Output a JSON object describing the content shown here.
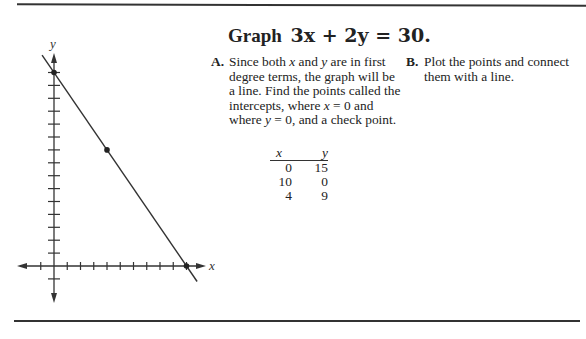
{
  "title": {
    "prefix": "Graph",
    "equation": "3x + 2y = 30."
  },
  "steps": [
    {
      "letter": "A.",
      "text_parts": [
        "Since both ",
        "x",
        " and ",
        "y",
        " are in first degree terms, the graph will be a line. Find the points called the intercepts, where ",
        "x",
        " = 0 and where ",
        "y",
        " = 0, and a check point."
      ]
    },
    {
      "letter": "B.",
      "text": "Plot the points and connect them with a line."
    }
  ],
  "table": {
    "headers": [
      "x",
      "y"
    ],
    "rows": [
      [
        "0",
        "15"
      ],
      [
        "10",
        "0"
      ],
      [
        "4",
        "9"
      ]
    ]
  },
  "chart_data": {
    "type": "line",
    "xlabel": "x",
    "ylabel": "y",
    "equation": "3x + 2y = 30",
    "points": [
      {
        "x": 0,
        "y": 15,
        "label": "y-intercept"
      },
      {
        "x": 4,
        "y": 9,
        "label": "check point"
      },
      {
        "x": 10,
        "y": 0,
        "label": "x-intercept"
      }
    ],
    "x_ticks_visible": [
      -1,
      1,
      2,
      3,
      4,
      5,
      6,
      7,
      8,
      9,
      10
    ],
    "y_ticks_visible": [
      -1,
      1,
      2,
      3,
      4,
      5,
      6,
      7,
      8,
      9,
      10,
      11,
      12,
      13,
      14,
      15
    ],
    "xlim": [
      -2.5,
      11.5
    ],
    "ylim": [
      -2.8,
      17
    ],
    "tick_labels": false,
    "grid": false
  },
  "axes": {
    "x_label": "x",
    "y_label": "y"
  }
}
